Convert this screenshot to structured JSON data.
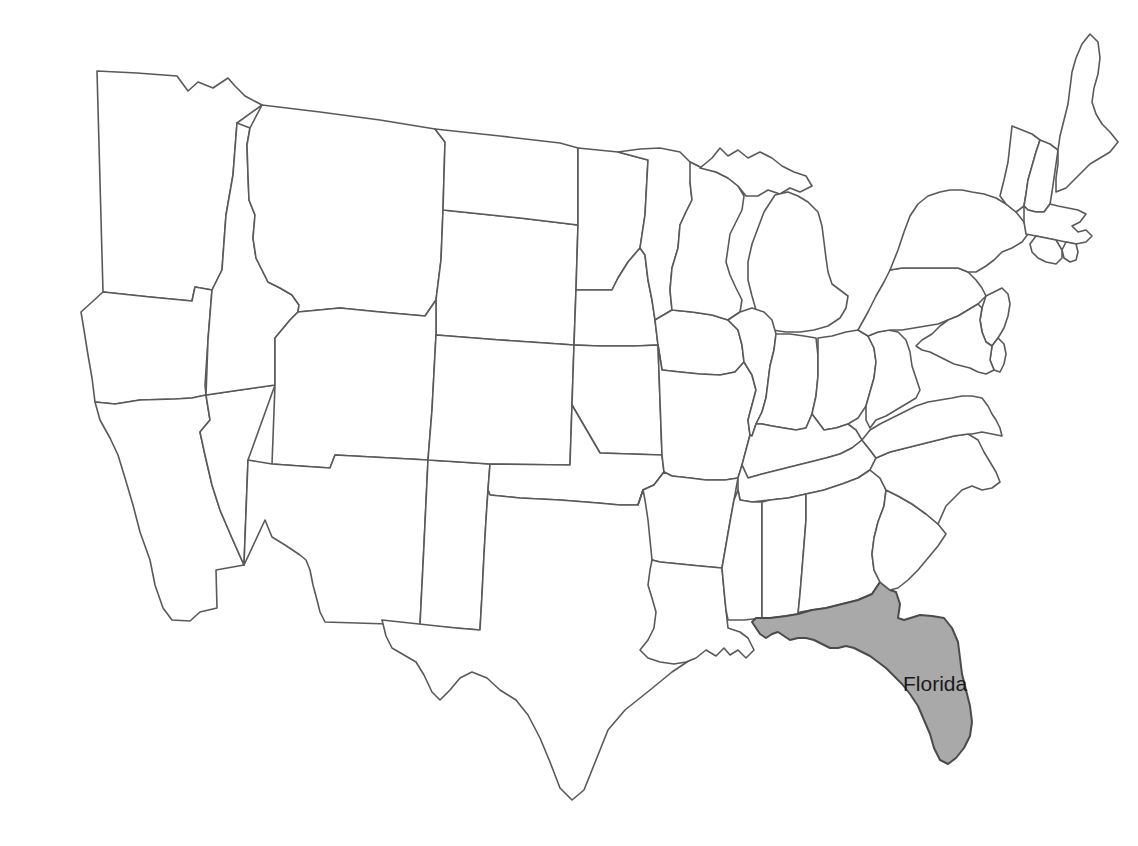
{
  "map": {
    "title": "United States Map",
    "type": "choropleth-locator",
    "projection": "albers-usa-approx",
    "background_color": "#ffffff",
    "default_state_fill": "#ffffff",
    "highlight_fill": "#a9a9a9",
    "border_color": "#595959",
    "label_color": "#1a1a1a",
    "canvas": {
      "width": 1138,
      "height": 846
    },
    "highlighted_state": "Florida",
    "labels": [
      {
        "id": "florida-label",
        "text": "Florida",
        "x": 903,
        "y": 691,
        "font_size": 21
      }
    ],
    "states": [
      {
        "id": "washington",
        "name": "Washington",
        "highlighted": false,
        "d": "M97,71 L137,73 L177,76 L188,91 L198,82 L213,88 L228,78 L235,86 L245,96 L262,105 L237,123 L233,175 L226,215 L222,270 L212,290 L195,287 L192,301 L150,297 L103,292 L97,71 Z"
      },
      {
        "id": "oregon",
        "name": "Oregon",
        "highlighted": false,
        "d": "M103,292 L150,297 L192,301 L195,287 L212,290 L208,340 L205,385 L206,395 L192,398 L175,399 L140,400 L115,404 L95,402 L92,378 L88,355 L84,330 L81,312 L103,292 Z"
      },
      {
        "id": "california",
        "name": "California",
        "highlighted": false,
        "d": "M95,402 L115,404 L140,400 L175,399 L192,398 L206,395 L210,420 L200,432 L205,455 L212,485 L220,510 L232,538 L244,565 L216,570 L217,608 L200,612 L190,621 L172,620 L163,608 L155,585 L150,560 L140,532 L133,505 L125,478 L118,455 L110,438 L100,420 L95,402 Z"
      },
      {
        "id": "nevada",
        "name": "Nevada",
        "highlighted": false,
        "d": "M206,395 L240,390 L275,385 L248,460 L244,565 L232,538 L220,510 L212,485 L205,455 L200,432 L210,420 L206,395 Z"
      },
      {
        "id": "idaho",
        "name": "Idaho",
        "highlighted": false,
        "d": "M237,123 L250,128 L247,145 L248,175 L249,200 L255,215 L253,238 L256,258 L262,270 L268,282 L280,288 L292,295 L299,305 L298,312 L290,320 L275,338 L275,385 L240,390 L206,395 L208,340 L212,290 L222,270 L226,215 L233,175 L237,123 Z"
      },
      {
        "id": "montana",
        "name": "Montana",
        "highlighted": false,
        "d": "M262,105 L320,112 L380,120 L435,129 L445,142 L443,210 L441,260 L436,300 L425,316 L380,312 L340,308 L298,312 L299,305 L292,295 L280,288 L268,282 L262,270 L256,258 L253,238 L255,215 L249,200 L248,175 L247,145 L250,128 L262,105 Z"
      },
      {
        "id": "wyoming",
        "name": "Wyoming",
        "highlighted": false,
        "d": "M436,300 L441,260 L443,210 L520,218 L578,225 L576,290 L574,345 L500,340 L436,335 L436,300 Z"
      },
      {
        "id": "utah",
        "name": "Utah",
        "highlighted": false,
        "d": "M275,385 L275,338 L290,320 L298,312 L340,308 L380,312 L425,316 L436,300 L436,335 L432,410 L428,460 L335,455 L330,468 L300,466 L272,464 L275,385 Z"
      },
      {
        "id": "arizona",
        "name": "Arizona",
        "highlighted": false,
        "d": "M272,464 L300,466 L330,468 L335,455 L428,460 L424,545 L420,625 L325,622 L320,612 L317,600 L313,585 L310,570 L306,560 L300,555 L285,545 L272,537 L265,520 L244,565 L248,460 L272,464 Z"
      },
      {
        "id": "new-mexico",
        "name": "New Mexico",
        "highlighted": false,
        "d": "M428,460 L460,462 L490,464 L488,490 L486,520 L484,555 L482,595 L480,630 L456,628 L420,625 L424,545 L428,460 Z"
      },
      {
        "id": "colorado",
        "name": "Colorado",
        "highlighted": false,
        "d": "M436,335 L500,340 L574,345 L572,405 L570,465 L490,464 L460,462 L428,460 L432,410 L436,335 Z"
      },
      {
        "id": "north-dakota",
        "name": "North Dakota",
        "highlighted": false,
        "d": "M435,129 L500,136 L560,143 L578,148 L578,225 L520,218 L443,210 L445,142 L435,129 Z"
      },
      {
        "id": "south-dakota",
        "name": "South Dakota",
        "highlighted": false,
        "d": "M578,225 L578,148 L618,152 L648,160 L645,215 L640,248 L628,262 L618,278 L612,290 L576,290 L578,225 Z"
      },
      {
        "id": "nebraska",
        "name": "Nebraska",
        "highlighted": false,
        "d": "M576,290 L612,290 L618,278 L628,262 L640,248 L645,255 L648,280 L652,300 L655,320 L658,345 L635,346 L600,346 L574,345 L576,290 Z"
      },
      {
        "id": "kansas",
        "name": "Kansas",
        "highlighted": false,
        "d": "M574,345 L600,346 L635,346 L658,345 L660,400 L662,455 L600,453 L572,405 L574,345 Z"
      },
      {
        "id": "oklahoma",
        "name": "Oklahoma",
        "highlighted": false,
        "d": "M572,405 L600,453 L662,455 L664,472 L654,485 L643,490 L638,505 L620,505 L598,503 L560,500 L520,498 L490,495 L488,490 L490,464 L570,465 L572,405 Z"
      },
      {
        "id": "texas",
        "name": "Texas",
        "highlighted": false,
        "d": "M488,490 L490,495 L520,498 L560,500 L598,503 L620,505 L638,505 L643,490 L654,485 L664,472 L668,520 L672,560 L678,600 L690,620 L702,640 L690,660 L672,672 L650,690 L625,710 L608,730 L596,760 L584,790 L572,800 L560,788 L550,762 L540,738 L528,715 L516,700 L500,690 L487,678 L472,672 L460,678 L450,690 L440,700 L432,692 L424,675 L416,662 L404,655 L392,648 L386,636 L382,620 L456,628 L480,630 L482,595 L484,555 L486,520 L488,490 Z"
      },
      {
        "id": "minnesota",
        "name": "Minnesota",
        "highlighted": false,
        "d": "M618,152 L640,149 L660,148 L680,152 L690,162 L702,168 L690,182 L692,200 L686,212 L680,225 L678,248 L672,268 L670,290 L672,310 L655,320 L652,300 L648,280 L645,255 L640,248 L645,215 L648,160 L618,152 Z"
      },
      {
        "id": "iowa",
        "name": "Iowa",
        "highlighted": false,
        "d": "M655,320 L672,310 L692,312 L712,315 L728,320 L738,330 L742,345 L744,362 L735,372 L720,375 L700,374 L680,372 L662,370 L658,345 L655,320 Z"
      },
      {
        "id": "missouri",
        "name": "Missouri",
        "highlighted": false,
        "d": "M658,345 L662,370 L680,372 L700,374 L720,375 L735,372 L744,362 L752,375 L756,390 L752,405 L748,420 L750,435 L746,450 L742,465 L738,478 L725,480 L706,480 L690,478 L672,476 L664,472 L662,455 L660,400 L658,345 Z"
      },
      {
        "id": "arkansas",
        "name": "Arkansas",
        "highlighted": false,
        "d": "M664,472 L672,476 L690,478 L706,480 L725,480 L738,478 L734,500 L730,522 L726,545 L722,568 L700,566 L680,564 L660,562 L652,560 L650,540 L648,520 L645,500 L643,490 L638,505 L643,490 L654,485 L664,472 Z"
      },
      {
        "id": "louisiana",
        "name": "Louisiana",
        "highlighted": false,
        "d": "M652,560 L660,562 L680,564 L700,566 L722,568 L724,590 L726,610 L728,628 L740,632 L748,638 L754,650 L746,658 L738,650 L730,655 L724,648 L716,656 L706,650 L696,658 L686,662 L674,664 L660,662 L648,658 L640,650 L648,640 L654,628 L656,612 L652,598 L648,585 L650,570 L652,560 Z"
      },
      {
        "id": "wisconsin",
        "name": "Wisconsin",
        "highlighted": false,
        "d": "M690,162 L702,168 L716,172 L728,178 L738,186 L744,196 L742,210 L736,222 L730,234 L728,248 L726,262 L730,275 L736,288 L742,300 L740,312 L728,320 L712,315 L692,312 L672,310 L670,290 L672,268 L678,248 L680,225 L686,212 L692,200 L690,182 L690,162 Z"
      },
      {
        "id": "michigan-upper",
        "name": "Michigan Upper Peninsula",
        "highlighted": false,
        "d": "M700,168 L712,158 L720,148 L728,156 L738,150 L748,158 L760,152 L772,158 L782,166 L794,172 L806,176 L812,186 L800,192 L790,188 L780,194 L768,190 L758,196 L746,196 L738,186 L728,178 L716,172 L700,168 Z"
      },
      {
        "id": "michigan-lower",
        "name": "Michigan Lower Peninsula",
        "highlighted": false,
        "d": "M775,195 L788,192 L798,196 L808,202 L818,212 L822,226 L824,242 L826,258 L828,272 L832,284 L840,290 L848,296 L846,308 L840,318 L828,326 L814,330 L800,332 L786,332 L772,330 L762,322 L756,310 L752,296 L748,280 L748,262 L752,244 L758,228 L764,212 L775,195 Z"
      },
      {
        "id": "illinois",
        "name": "Illinois",
        "highlighted": false,
        "d": "M740,312 L752,308 L764,312 L772,320 L776,334 L774,350 L770,366 L768,382 L766,398 L762,412 L756,424 L752,436 L750,435 L748,420 L752,405 L756,390 L752,375 L744,362 L742,345 L738,330 L728,320 L740,312 Z"
      },
      {
        "id": "indiana",
        "name": "Indiana",
        "highlighted": false,
        "d": "M776,334 L790,334 L804,336 L816,338 L818,356 L818,376 L816,396 L812,414 L806,428 L796,430 L784,428 L772,426 L762,424 L756,424 L762,412 L766,398 L768,382 L770,366 L774,350 L776,334 Z"
      },
      {
        "id": "ohio",
        "name": "Ohio",
        "highlighted": false,
        "d": "M818,338 L832,336 L846,332 L858,330 L868,336 L874,348 L876,362 L874,378 L870,392 L866,406 L858,418 L848,424 L836,428 L824,430 L812,414 L816,396 L818,376 L818,356 L818,338 Z"
      },
      {
        "id": "kentucky",
        "name": "Kentucky",
        "highlighted": false,
        "d": "M752,436 L756,424 L762,424 L772,426 L784,428 L796,430 L806,428 L812,414 L824,430 L836,428 L848,424 L856,430 L862,440 L852,448 L840,454 L826,458 L810,462 L794,466 L778,470 L762,474 L748,478 L742,465 L746,450 L750,435 L752,436 Z"
      },
      {
        "id": "tennessee",
        "name": "Tennessee",
        "highlighted": false,
        "d": "M742,465 L748,478 L762,474 L778,470 L794,466 L810,462 L826,458 L840,454 L852,448 L862,440 L870,450 L876,458 L870,470 L858,478 L842,484 L824,490 L806,494 L788,498 L770,500 L752,502 L740,500 L738,490 L738,478 L742,465 Z"
      },
      {
        "id": "mississippi",
        "name": "Mississippi",
        "highlighted": false,
        "d": "M722,568 L726,545 L730,522 L734,500 L738,490 L740,500 L752,502 L762,502 L762,520 L762,545 L762,570 L762,596 L762,618 L744,620 L728,620 L726,610 L724,590 L722,568 Z"
      },
      {
        "id": "alabama",
        "name": "Alabama",
        "highlighted": false,
        "d": "M762,502 L770,500 L788,498 L806,494 L806,520 L804,545 L802,570 L800,594 L798,614 L786,616 L770,618 L762,618 L762,596 L762,570 L762,545 L762,520 L762,502 Z"
      },
      {
        "id": "georgia",
        "name": "Georgia",
        "highlighted": false,
        "d": "M806,494 L824,490 L842,484 L858,478 L870,470 L880,478 L886,490 L884,506 L878,522 L874,538 L872,554 L874,570 L880,582 L872,594 L858,600 L842,604 L826,608 L812,610 L800,612 L798,614 L800,594 L802,570 L804,545 L806,520 L806,494 Z"
      },
      {
        "id": "florida",
        "name": "Florida",
        "highlighted": true,
        "d": "M798,614 L812,610 L826,608 L842,604 L858,600 L872,594 L880,582 L890,590 L896,592 L900,604 L898,618 L904,620 L920,615 L932,616 L944,618 L952,628 L958,642 L960,658 L962,674 L966,690 L970,706 L972,722 L970,736 L964,748 L956,758 L948,764 L940,760 L934,748 L930,734 L924,720 L918,706 L910,694 L902,684 L894,676 L886,668 L878,662 L870,656 L862,652 L854,648 L846,646 L838,648 L830,648 L822,644 L814,640 L806,638 L798,638 L790,640 L784,636 L778,632 L772,634 L766,638 L760,634 L756,628 L752,622 L756,618 L762,618 L770,618 L786,616 L798,614 Z"
      },
      {
        "id": "south-carolina",
        "name": "South Carolina",
        "highlighted": false,
        "d": "M874,538 L878,522 L884,506 L886,490 L898,496 L912,504 L926,514 L938,524 L946,534 L938,546 L928,558 L918,570 L908,580 L898,588 L890,590 L880,582 L874,570 L872,554 L874,538 Z"
      },
      {
        "id": "north-carolina",
        "name": "North Carolina",
        "highlighted": false,
        "d": "M870,470 L876,458 L890,452 L906,448 L922,444 L938,440 L954,436 L968,434 L978,440 L984,452 L990,462 L996,472 L1000,482 L992,488 L982,490 L972,486 L962,490 L954,498 L946,506 L938,524 L926,514 L912,504 L898,496 L886,490 L880,478 L870,470 Z"
      },
      {
        "id": "virginia",
        "name": "Virginia",
        "highlighted": false,
        "d": "M862,440 L870,430 L880,424 L892,418 L904,412 L916,406 L928,402 L940,400 L952,398 L962,396 L972,396 L982,398 L988,406 L992,414 L996,420 L1000,428 L1002,436 L992,434 L982,432 L972,434 L968,434 L954,436 L938,440 L922,444 L906,448 L890,452 L876,458 L870,450 L862,440 Z"
      },
      {
        "id": "west-virginia",
        "name": "West Virginia",
        "highlighted": false,
        "d": "M868,336 L878,332 L888,330 L898,332 L906,340 L910,352 L912,366 L916,378 L920,390 L916,398 L906,404 L896,410 L886,416 L876,420 L870,428 L866,420 L866,406 L870,392 L874,378 L876,362 L874,348 L868,336 Z"
      },
      {
        "id": "pennsylvania",
        "name": "Pennsylvania",
        "highlighted": false,
        "d": "M858,330 L868,312 L876,296 L884,282 L890,270 L902,268 L916,268 L930,268 L944,268 L958,268 L968,272 L976,280 L982,288 L986,296 L978,304 L968,310 L958,316 L948,320 L938,324 L926,326 L914,328 L902,330 L890,330 L878,332 L868,336 L858,330 Z"
      },
      {
        "id": "new-york",
        "name": "New York",
        "highlighted": false,
        "d": "M890,270 L898,250 L904,232 L910,216 L918,204 L928,196 L940,192 L950,190 L962,190 L972,192 L984,194 L996,198 L1006,204 L1016,212 L1024,222 L1028,234 L1022,242 L1012,248 L1002,252 L994,260 L986,266 L976,272 L968,272 L958,268 L944,268 L930,268 L916,268 L902,268 L890,270 Z"
      },
      {
        "id": "vermont",
        "name": "Vermont",
        "highlighted": false,
        "d": "M1012,126 L1022,130 L1032,134 L1040,140 L1036,152 L1032,166 L1028,180 L1026,194 L1024,206 L1016,212 L1006,204 L1000,196 L1004,180 L1008,162 L1010,144 L1012,126 Z"
      },
      {
        "id": "new-hampshire",
        "name": "New Hampshire",
        "highlighted": false,
        "d": "M1040,140 L1050,144 L1058,150 L1056,164 L1054,178 L1052,192 L1050,204 L1044,212 L1036,212 L1028,210 L1024,206 L1026,194 L1028,180 L1032,166 L1036,152 L1040,140 Z"
      },
      {
        "id": "maine",
        "name": "Maine",
        "highlighted": false,
        "d": "M1058,150 L1060,136 L1064,120 L1068,104 L1070,88 L1072,72 L1076,58 L1082,44 L1090,34 L1098,42 L1100,58 L1098,74 L1094,88 L1092,102 L1096,114 L1102,124 L1110,132 L1118,142 L1110,152 L1100,158 L1090,164 L1082,172 L1074,180 L1066,188 L1056,192 L1056,178 L1058,164 L1058,150 Z"
      },
      {
        "id": "massachusetts",
        "name": "Massachusetts",
        "highlighted": false,
        "d": "M1024,206 L1028,210 L1036,212 L1044,212 L1050,204 L1058,206 L1068,208 L1078,210 L1086,214 L1080,222 L1072,226 L1078,232 L1086,230 L1092,236 L1086,242 L1076,244 L1066,242 L1056,240 L1046,238 L1036,236 L1026,234 L1024,222 L1024,206 Z"
      },
      {
        "id": "rhode-island",
        "name": "Rhode Island",
        "highlighted": false,
        "d": "M1066,242 L1076,244 L1078,252 L1076,260 L1070,262 L1064,258 L1062,250 L1066,242 Z"
      },
      {
        "id": "connecticut",
        "name": "Connecticut",
        "highlighted": false,
        "d": "M1036,236 L1046,238 L1056,240 L1062,250 L1062,258 L1056,264 L1046,262 L1038,258 L1032,252 L1030,244 L1036,236 Z"
      },
      {
        "id": "new-jersey",
        "name": "New Jersey",
        "highlighted": false,
        "d": "M986,296 L994,292 L1002,288 L1008,294 L1010,304 L1008,316 L1004,328 L998,338 L992,346 L986,342 L982,332 L980,320 L982,308 L986,296 Z"
      },
      {
        "id": "delaware",
        "name": "Delaware",
        "highlighted": false,
        "d": "M992,346 L998,338 L1004,344 L1006,354 L1004,364 L1000,372 L994,370 L990,360 L992,346 Z"
      },
      {
        "id": "maryland",
        "name": "Maryland",
        "highlighted": false,
        "d": "M948,320 L958,316 L968,310 L978,304 L982,308 L980,320 L982,332 L986,342 L992,346 L990,360 L994,370 L986,374 L978,372 L970,368 L962,366 L954,364 L946,360 L938,356 L930,352 L922,350 L916,346 L922,340 L932,334 L940,326 L948,320 Z"
      }
    ]
  }
}
